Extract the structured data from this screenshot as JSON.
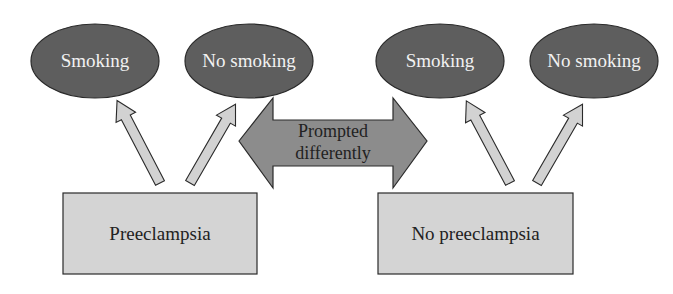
{
  "diagram": {
    "colors": {
      "oval_fill": "#5e5e5e",
      "box_fill": "#d4d4d4",
      "double_arrow_fill": "#8c8c8c",
      "up_arrow_fill": "#d2d2d2",
      "stroke": "#2a2a2a"
    },
    "ovals": [
      {
        "label": "Smoking"
      },
      {
        "label": "No smoking"
      },
      {
        "label": "Smoking"
      },
      {
        "label": "No smoking"
      }
    ],
    "boxes": [
      {
        "label": "Preeclampsia"
      },
      {
        "label": "No preeclampsia"
      }
    ],
    "double_arrow": {
      "line1": "Prompted",
      "line2": "differently"
    },
    "connections": [
      {
        "from": "Preeclampsia",
        "to": "Smoking"
      },
      {
        "from": "Preeclampsia",
        "to": "No smoking"
      },
      {
        "from": "No preeclampsia",
        "to": "Smoking"
      },
      {
        "from": "No preeclampsia",
        "to": "No smoking"
      }
    ]
  }
}
